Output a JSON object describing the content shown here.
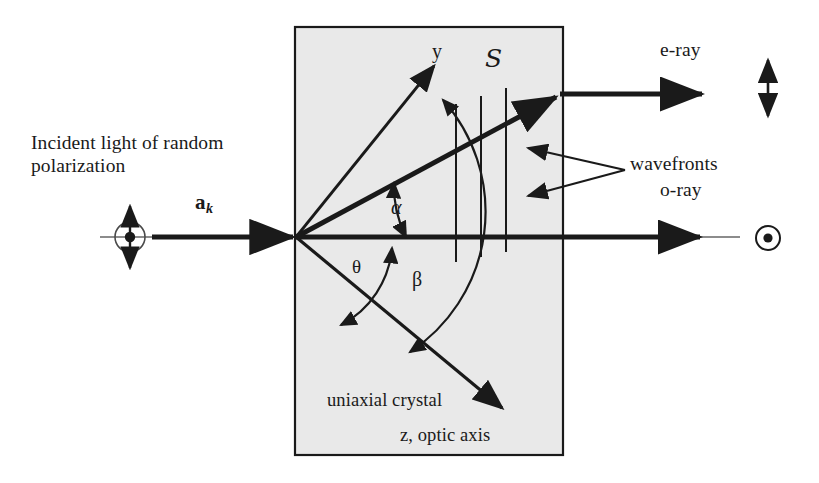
{
  "figure": {
    "background_color": "#ffffff",
    "crystal_fill_color": "#e9e9e9",
    "stroke_color": "#1a1a1a"
  },
  "labels": {
    "incident_light": "Incident light of random polarization",
    "wave_vector": "a",
    "wave_vector_subscript": "k",
    "y_axis": "y",
    "poynting_vector": "S",
    "angle_alpha": "α",
    "angle_theta": "θ",
    "angle_beta": "β",
    "crystal_name": "uniaxial crystal",
    "optic_axis": "z, optic axis",
    "e_ray": "e-ray",
    "o_ray": "o-ray",
    "wavefronts": "wavefronts"
  },
  "geometry": {
    "crystal_box": {
      "x": 295,
      "y": 27,
      "width": 268,
      "height": 428
    },
    "origin": {
      "x": 296,
      "y": 237
    },
    "incident_ray": {
      "x1": 100,
      "y1": 237,
      "x2": 296,
      "y2": 237
    },
    "polarization_marker": {
      "cx": 130,
      "cy": 237,
      "r": 15
    },
    "y_axis_arrow": {
      "x1": 296,
      "y1": 237,
      "x2": 437,
      "y2": 63
    },
    "e_ray_in_crystal": {
      "x1": 296,
      "y1": 237,
      "x2": 560,
      "y2": 94
    },
    "e_ray_out": {
      "x1": 560,
      "y1": 94,
      "x2": 706,
      "y2": 94
    },
    "o_ray": {
      "x1": 296,
      "y1": 237,
      "x2": 708,
      "y2": 237
    },
    "optic_axis_arrow": {
      "x1": 296,
      "y1": 237,
      "x2": 506,
      "y2": 411
    },
    "wavefront_lines_x": [
      456,
      481,
      506
    ],
    "e_ray_polarization_arrow": {
      "x": 768,
      "y_top": 62,
      "y_bottom": 116
    },
    "o_ray_polarization_marker": {
      "cx": 768,
      "cy": 238,
      "r": 12
    }
  },
  "symbols": {
    "incident_polarization": "circle-dot-with-double-arrow",
    "e_ray_polarization": "vertical-double-arrow",
    "o_ray_polarization": "circle-dot"
  }
}
